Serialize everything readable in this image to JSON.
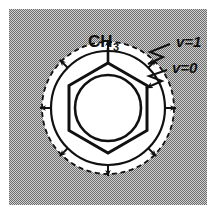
{
  "figure": {
    "name": "toluene-vibrational-shell-diagram",
    "width": 216,
    "height": 219,
    "background_color": "#9a9a9a",
    "background_pattern": "dithered-halftone-gray",
    "plate_margin_color": "#ffffff"
  },
  "molecule": {
    "name": "toluene",
    "ring_type": "benzene-aromatic",
    "ring_vertices": 6,
    "substituent_label": "CH",
    "substituent_subscript": "3",
    "substituent_position": "top",
    "inner_circle_note": "aromatic delocalization circle"
  },
  "shells": {
    "inner": {
      "label": "v=0",
      "boundary_style": "solid",
      "radius_px": 57,
      "color": "#111111"
    },
    "outer": {
      "label": "v=1",
      "boundary_style": "dashed",
      "radius_px": 66,
      "color": "#111111"
    },
    "annulus_fill": "#ffffff"
  },
  "arrows": {
    "name": "radial-expansion-arrows",
    "count": 8,
    "direction": "outward",
    "angles_deg": [
      0,
      45,
      90,
      135,
      180,
      225,
      270,
      315
    ],
    "color": "#111111"
  },
  "labels": [
    {
      "id": "v1",
      "text": "v=1",
      "x": 176,
      "y": 47,
      "leader": "zigzag",
      "points_to": "outer-dashed-shell"
    },
    {
      "id": "v0",
      "text": "v=0",
      "x": 172,
      "y": 73,
      "leader": "zigzag",
      "points_to": "inner-solid-shell"
    }
  ],
  "geometry": {
    "center_x": 108,
    "center_y": 108,
    "hexagon_radius_px": 45,
    "aromatic_circle_radius_px": 33,
    "methyl_bond_length_px": 16
  }
}
